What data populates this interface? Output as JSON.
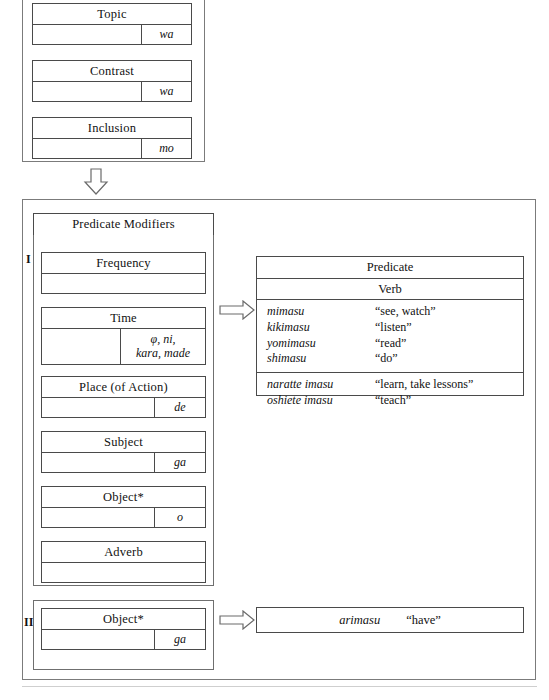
{
  "diagram": {
    "topic_group": {
      "name": "topic-contrast-inclusion-group",
      "slots": [
        {
          "label": "Topic",
          "particle": "wa"
        },
        {
          "label": "Contrast",
          "particle": "wa"
        },
        {
          "label": "Inclusion",
          "particle": "mo"
        }
      ]
    },
    "down_arrow": {
      "name": "down-arrow",
      "direction": "down"
    },
    "pattern_I": {
      "numeral": "I",
      "modifiers_label": "Predicate Modifiers",
      "slots": [
        {
          "label": "Frequency",
          "particle": ""
        },
        {
          "label": "Time",
          "particle": "φ, ni,\nkara, made"
        },
        {
          "label": "Place (of Action)",
          "particle": "de"
        },
        {
          "label": "Subject",
          "particle": "ga"
        },
        {
          "label": "Object*",
          "particle": "o"
        },
        {
          "label": "Adverb",
          "particle": ""
        }
      ],
      "arrow": {
        "name": "right-arrow-pattern-one",
        "direction": "right"
      },
      "predicate": {
        "header": "Predicate",
        "subheader": "Verb",
        "groups": [
          {
            "entries": [
              {
                "term": "mimasu",
                "gloss": "“see, watch”"
              },
              {
                "term": "kikimasu",
                "gloss": "“listen”"
              },
              {
                "term": "yomimasu",
                "gloss": "“read”"
              },
              {
                "term": "shimasu",
                "gloss": "“do”"
              }
            ]
          },
          {
            "entries": [
              {
                "term": "naratte imasu",
                "gloss": "“learn, take lessons”"
              },
              {
                "term": "oshiete imasu",
                "gloss": "“teach”"
              }
            ]
          }
        ]
      }
    },
    "pattern_II": {
      "numeral": "II",
      "slots": [
        {
          "label": "Object*",
          "particle": "ga"
        }
      ],
      "arrow": {
        "name": "right-arrow-pattern-two",
        "direction": "right"
      },
      "predicate_strip": {
        "term": "arimasu",
        "gloss": "“have”"
      }
    }
  }
}
